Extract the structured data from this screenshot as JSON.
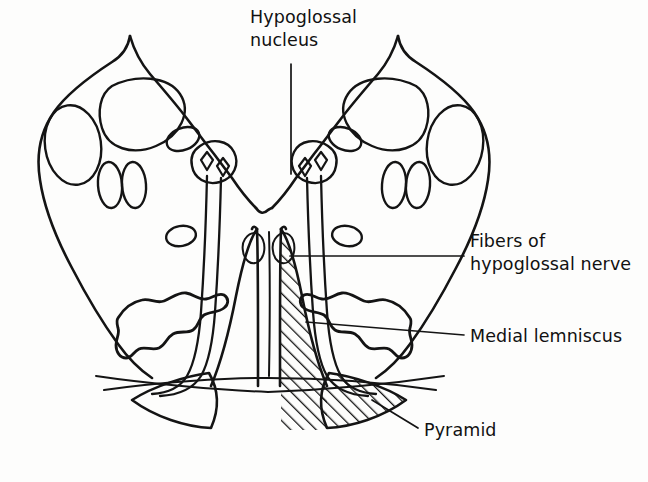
{
  "figure": {
    "background_color": "#fdfdfc",
    "ink_color": "#141414"
  },
  "labels": {
    "hypoglossal_nucleus": "Hypoglossal\nnucleus",
    "fibers_of_hypoglossal_nerve": "Fibers of\nhypoglossal nerve",
    "medial_lemniscus": "Medial lemniscus",
    "pyramid": "Pyramid"
  },
  "structures": [
    {
      "name": "hypoglossal-nucleus",
      "label": "Hypoglossal nucleus",
      "shaded": false,
      "side": "bilateral",
      "position": "dorsal paramedian, flanking the midline near the floor of the fourth ventricle"
    },
    {
      "name": "fibers-of-hypoglossal-nerve",
      "label": "Fibers of hypoglossal nerve",
      "shaded": false,
      "side": "bilateral",
      "position": "descending bundles running ventrally from the nuclei between the medial lemniscus and the inferior olive"
    },
    {
      "name": "medial-lemniscus",
      "label": "Medial lemniscus",
      "shaded": true,
      "side": "right side hatched",
      "position": "paramedian vertical column dorsal to the pyramid"
    },
    {
      "name": "pyramid",
      "label": "Pyramid",
      "shaded": true,
      "side": "right side hatched",
      "position": "ventral lobe at the base of the medulla"
    },
    {
      "name": "inferior-olivary-nucleus",
      "label": "Inferior olivary nucleus",
      "shaded": false,
      "side": "bilateral",
      "position": "crenated wavy outline within each lateral wing"
    }
  ],
  "shading": {
    "style": "diagonal hatching",
    "applied_to": [
      "medial lemniscus (right)",
      "pyramid (right)"
    ],
    "hatch_angle_deg": 45,
    "hatch_spacing_px": 9
  },
  "leader_lines": [
    {
      "from": "hypoglossal_nucleus",
      "to": "right hypoglossal nucleus",
      "style": "vertical"
    },
    {
      "from": "fibers_of_hypoglossal_nerve",
      "to": "right hypoglossal fiber bundle",
      "style": "horizontal"
    },
    {
      "from": "medial_lemniscus",
      "to": "right medial lemniscus column",
      "style": "horizontal"
    },
    {
      "from": "pyramid",
      "to": "right pyramid",
      "style": "diagonal"
    }
  ]
}
